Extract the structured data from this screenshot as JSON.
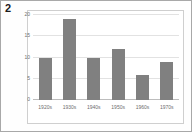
{
  "figure": {
    "number_label": "2",
    "background_color": "#fefefe",
    "border_color": "#a8a8a8",
    "plot_border_color": "#cfcfcf"
  },
  "chart_data": {
    "type": "bar",
    "title": "",
    "subtitle": "",
    "xlabel": "",
    "ylabel": "",
    "categories": [
      "1920s",
      "1930s",
      "1940s",
      "1950s",
      "1960s",
      "1970s"
    ],
    "values": [
      10,
      19,
      10,
      12,
      6,
      9
    ],
    "ylim": [
      0,
      20
    ],
    "yticks": [
      0,
      5,
      10,
      15,
      20
    ],
    "ytick_labels": [
      "0",
      "5",
      "10",
      "15",
      "20"
    ],
    "grid": true,
    "grid_axis": "y",
    "grid_color": "#e2e2e2",
    "legend": false,
    "legend_position": "none",
    "bar_color": "#808080",
    "axis_color": "#bdbdbd",
    "tick_label_color": "#6e6e6e",
    "annotations": []
  }
}
